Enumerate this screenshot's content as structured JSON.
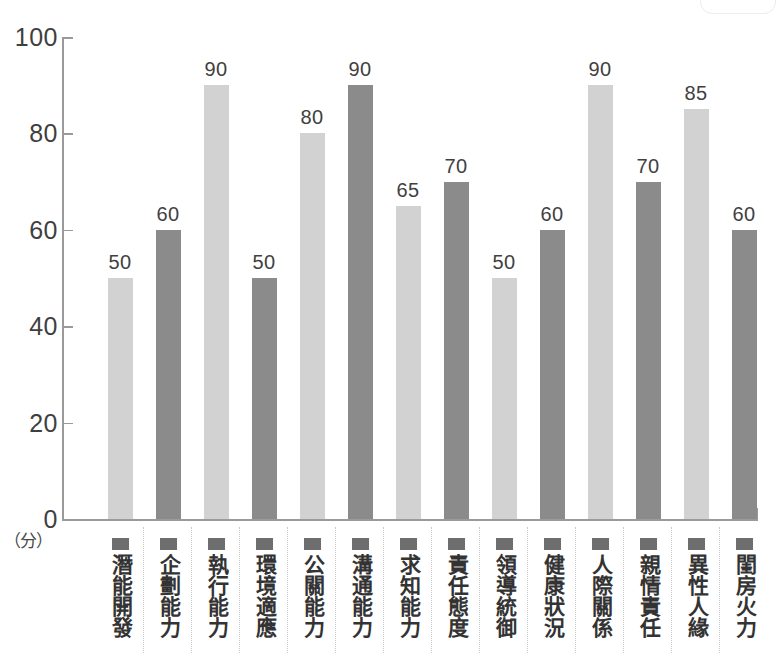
{
  "chart_data": {
    "type": "bar",
    "title": "",
    "xlabel": "",
    "ylabel": "",
    "unit_label": "（分）",
    "ylim": [
      0,
      100
    ],
    "ytick_labels": [
      "100",
      "80",
      "60",
      "40",
      "20",
      "0"
    ],
    "yticks": [
      100,
      80,
      60,
      40,
      20,
      0
    ],
    "grid": false,
    "legend": "none",
    "categories": [
      "潛能開發",
      "企劃能力",
      "執行能力",
      "環境適應",
      "公關能力",
      "溝通能力",
      "求知能力",
      "責任態度",
      "領導統御",
      "健康狀況",
      "人際關係",
      "親情責任",
      "異性人緣",
      "閨房火力"
    ],
    "values": [
      50,
      60,
      90,
      50,
      80,
      90,
      65,
      70,
      50,
      60,
      90,
      70,
      85,
      60
    ],
    "bar_shades": [
      "light",
      "dark",
      "light",
      "dark",
      "light",
      "dark",
      "light",
      "dark",
      "light",
      "dark",
      "light",
      "dark",
      "light",
      "dark"
    ],
    "colors": {
      "light_bar": "#d2d2d2",
      "dark_bar": "#8b8b8b",
      "axis": "#9a9a9a",
      "text": "#3f3f3f",
      "marker": "#6e6e6e",
      "separator": "#c8c8c8",
      "background": "#ffffff"
    }
  }
}
